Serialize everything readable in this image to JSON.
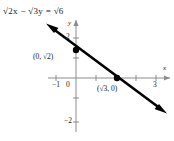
{
  "figure": {
    "equation": "√2x − √3y = √6",
    "axes": {
      "x_label": "x",
      "y_label": "y",
      "x_ticks": [
        {
          "value": -1,
          "label": "−1",
          "px": 56
        },
        {
          "value": 0,
          "label": "0",
          "px": 76
        },
        {
          "value": 2,
          "label": "",
          "px": 136
        },
        {
          "value": 3,
          "label": "3",
          "px": 156
        }
      ],
      "y_ticks": [
        {
          "value": 2,
          "label": "2",
          "px": 38
        },
        {
          "value": -2,
          "label": "−2",
          "px": 122
        }
      ],
      "origin_px": {
        "x": 76,
        "y": 78
      },
      "unit_px": 20
    },
    "line": {
      "start_px": {
        "x": 48,
        "y": 25
      },
      "end_px": {
        "x": 165,
        "y": 112
      },
      "color": "#000000",
      "arrows": "both"
    },
    "points": [
      {
        "label": "(0, √2)",
        "px": {
          "x": 76,
          "y": 50
        },
        "label_px": {
          "x": 33,
          "y": 53
        }
      },
      {
        "label": "(√3, 0)",
        "px": {
          "x": 117,
          "y": 78
        },
        "label_px": {
          "x": 97,
          "y": 85
        }
      }
    ],
    "colors": {
      "axis": "#8c8c8c",
      "line": "#000000",
      "text": "#222222",
      "background": "#ffffff"
    }
  }
}
